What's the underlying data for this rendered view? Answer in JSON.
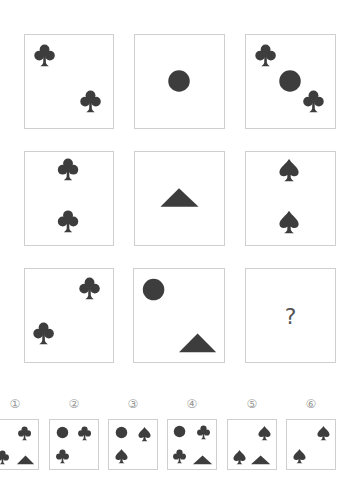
{
  "puzzle": {
    "shape_color": "#3d3d3d",
    "border_color": "#cfcfcf",
    "grid": [
      {
        "row": 1,
        "col": 1,
        "shapes": [
          "club",
          "club"
        ]
      },
      {
        "row": 1,
        "col": 2,
        "shapes": [
          "circle"
        ]
      },
      {
        "row": 1,
        "col": 3,
        "shapes": [
          "club",
          "circle",
          "club"
        ]
      },
      {
        "row": 2,
        "col": 1,
        "shapes": [
          "club",
          "club"
        ]
      },
      {
        "row": 2,
        "col": 2,
        "shapes": [
          "triangle"
        ]
      },
      {
        "row": 2,
        "col": 3,
        "shapes": [
          "spade",
          "spade"
        ]
      },
      {
        "row": 3,
        "col": 1,
        "shapes": [
          "club",
          "club"
        ]
      },
      {
        "row": 3,
        "col": 2,
        "shapes": [
          "circle",
          "triangle"
        ]
      },
      {
        "row": 3,
        "col": 3,
        "shapes": [],
        "text": "?"
      }
    ],
    "question_mark": "?"
  },
  "options": [
    {
      "label": "①",
      "shapes": [
        "club",
        "club",
        "triangle"
      ]
    },
    {
      "label": "②",
      "shapes": [
        "circle",
        "club",
        "club"
      ]
    },
    {
      "label": "③",
      "shapes": [
        "circle",
        "spade",
        "spade"
      ]
    },
    {
      "label": "④",
      "shapes": [
        "circle",
        "club",
        "club",
        "triangle"
      ]
    },
    {
      "label": "⑤",
      "shapes": [
        "spade",
        "spade",
        "triangle"
      ]
    },
    {
      "label": "⑥",
      "shapes": [
        "spade",
        "spade"
      ]
    }
  ]
}
